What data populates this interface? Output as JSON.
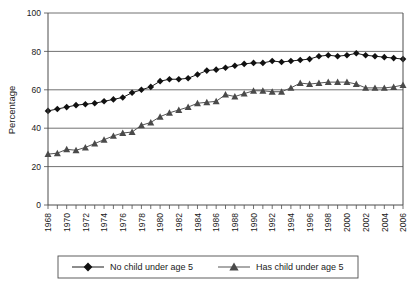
{
  "chart_data": {
    "type": "line",
    "title": "",
    "subtitle": "",
    "xlabel": "",
    "ylabel": "Percentage",
    "ylim": [
      0,
      100
    ],
    "yticks": [
      0,
      20,
      40,
      60,
      80,
      100
    ],
    "xlim": [
      1968,
      2006
    ],
    "xticks": [
      1968,
      1969,
      1970,
      1971,
      1972,
      1973,
      1974,
      1975,
      1976,
      1977,
      1978,
      1979,
      1980,
      1981,
      1982,
      1983,
      1984,
      1985,
      1986,
      1987,
      1988,
      1989,
      1990,
      1991,
      1992,
      1993,
      1994,
      1995,
      1996,
      1997,
      1998,
      1999,
      2000,
      2001,
      2002,
      2003,
      2004,
      2005,
      2006
    ],
    "xticklabels": [
      "1968",
      "",
      "1970",
      "",
      "1972",
      "",
      "1974",
      "",
      "1976",
      "",
      "1978",
      "",
      "1980",
      "",
      "1982",
      "",
      "1984",
      "",
      "1986",
      "",
      "1988",
      "",
      "1990",
      "",
      "1992",
      "",
      "1994",
      "",
      "1996",
      "",
      "1998",
      "",
      "2000",
      "",
      "2002",
      "",
      "2004",
      "",
      "2006"
    ],
    "grid": "horizontal",
    "legend_position": "bottom",
    "x": [
      1968,
      1969,
      1970,
      1971,
      1972,
      1973,
      1974,
      1975,
      1976,
      1977,
      1978,
      1979,
      1980,
      1981,
      1982,
      1983,
      1984,
      1985,
      1986,
      1987,
      1988,
      1989,
      1990,
      1991,
      1992,
      1993,
      1994,
      1995,
      1996,
      1997,
      1998,
      1999,
      2000,
      2001,
      2002,
      2003,
      2004,
      2005,
      2006
    ],
    "series": [
      {
        "name": "No child under age 5",
        "marker": "diamond",
        "color": "#111111",
        "values": [
          49,
          50,
          51,
          52,
          52.5,
          53,
          54,
          55,
          56,
          58.5,
          60,
          61.5,
          64.5,
          65.5,
          65.5,
          66,
          68,
          70,
          70.5,
          71.5,
          72.5,
          73.5,
          74,
          74,
          75,
          74.5,
          75,
          75.5,
          76,
          77.5,
          78,
          77.5,
          78,
          79,
          78,
          77.5,
          77,
          76.5,
          76
        ]
      },
      {
        "name": "Has child under age 5",
        "marker": "triangle",
        "color": "#4a4a4a",
        "values": [
          26.5,
          27,
          29,
          28.5,
          30,
          32,
          34,
          36,
          37.5,
          38,
          41.5,
          43,
          46,
          48,
          49.5,
          51,
          53,
          53.5,
          54,
          57.5,
          56.5,
          58,
          59.5,
          59.5,
          59,
          59,
          61,
          63.5,
          63,
          63.5,
          64,
          64,
          64,
          63,
          61,
          61,
          61,
          61.5,
          62.5
        ]
      }
    ]
  },
  "legend": {
    "entries": [
      {
        "label": "No child under age 5",
        "marker": "diamond-marker"
      },
      {
        "label": "Has child under age 5",
        "marker": "triangle-marker"
      }
    ]
  },
  "axes": {
    "y_title": "Percentage"
  }
}
